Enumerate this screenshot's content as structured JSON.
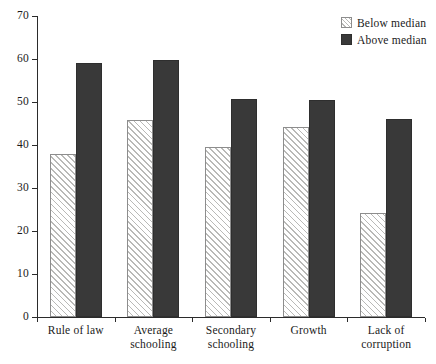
{
  "chart_data": {
    "type": "bar",
    "title": "",
    "subtitle": "",
    "xlabel": "",
    "ylabel": "",
    "ylim": [
      0,
      70
    ],
    "yticks": [
      0,
      10,
      20,
      30,
      40,
      50,
      60,
      70
    ],
    "ytick_labels": [
      "0",
      "10",
      "20",
      "30",
      "40",
      "50",
      "60",
      "70"
    ],
    "grid": false,
    "legend_position": "top-right",
    "categories": [
      "Rule of law",
      "Average schooling",
      "Secondary schooling",
      "Growth",
      "Lack of corruption"
    ],
    "category_lines": [
      [
        "Rule of law"
      ],
      [
        "Average",
        "schooling"
      ],
      [
        "Secondary",
        "schooling"
      ],
      [
        "Growth"
      ],
      [
        "Lack of",
        "corruption"
      ]
    ],
    "series": [
      {
        "name": "Below median",
        "color": "#f4f4f2",
        "pattern": "diagonal-hatch",
        "values": [
          38,
          45.8,
          39.6,
          44.3,
          24.2
        ]
      },
      {
        "name": "Above median",
        "color": "#393939",
        "pattern": "solid",
        "values": [
          59,
          59.8,
          50.6,
          50.4,
          46
        ]
      }
    ]
  },
  "legend": {
    "items": [
      {
        "label": "Below median",
        "swatch": "hatched-square-icon"
      },
      {
        "label": "Above median",
        "swatch": "filled-square-icon"
      }
    ]
  },
  "axes": {
    "y_tick_labels": [
      "70",
      "60",
      "50",
      "40",
      "30",
      "20",
      "10",
      "0"
    ],
    "x_tick_labels": [
      "Rule of law",
      "Average schooling",
      "Secondary schooling",
      "Growth",
      "Lack of corruption"
    ]
  },
  "colors": {
    "below_median_fill": "#f4f4f2",
    "below_median_hatch": "#b9b9b7",
    "above_median_fill": "#393939",
    "axis": "#2b2b2b",
    "background": "#ffffff",
    "text": "#1a1a1a"
  }
}
